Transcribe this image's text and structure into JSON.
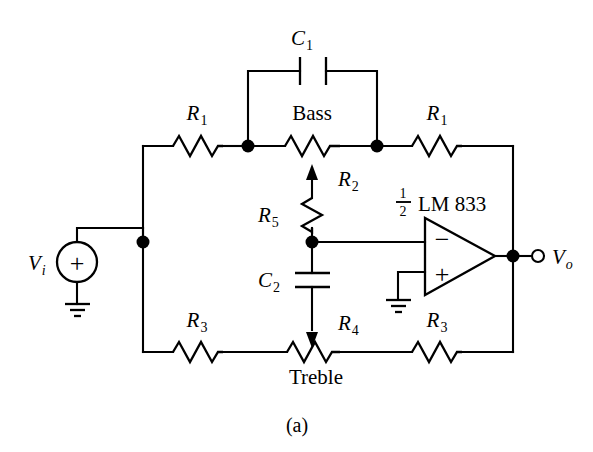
{
  "figure": {
    "caption": "(a)"
  },
  "labels": {
    "c1": "C",
    "c1_sub": "1",
    "c2": "C",
    "c2_sub": "2",
    "r1_left": "R",
    "r1_left_sub": "1",
    "r1_right": "R",
    "r1_right_sub": "1",
    "r2": "R",
    "r2_sub": "2",
    "r3_left": "R",
    "r3_left_sub": "3",
    "r3_right": "R",
    "r3_right_sub": "3",
    "r4": "R",
    "r4_sub": "4",
    "r5": "R",
    "r5_sub": "5",
    "bass": "Bass",
    "treble": "Treble",
    "opamp_part": "LM 833",
    "opamp_frac_num": "1",
    "opamp_frac_den": "2",
    "vi": "V",
    "vi_sub": "i",
    "vo": "V",
    "vo_sub": "o",
    "source_polarity": "+",
    "opamp_inverting": "−",
    "opamp_noninverting": "+"
  },
  "components": [
    {
      "name": "R1",
      "type": "resistor",
      "orientation": "horizontal",
      "label": "R1"
    },
    {
      "name": "R1b",
      "type": "resistor",
      "orientation": "horizontal",
      "label": "R1"
    },
    {
      "name": "R2",
      "type": "potentiometer",
      "orientation": "horizontal",
      "label": "R2",
      "control": "Bass"
    },
    {
      "name": "R3",
      "type": "resistor",
      "orientation": "horizontal",
      "label": "R3"
    },
    {
      "name": "R3b",
      "type": "resistor",
      "orientation": "horizontal",
      "label": "R3"
    },
    {
      "name": "R4",
      "type": "potentiometer",
      "orientation": "horizontal",
      "label": "R4",
      "control": "Treble"
    },
    {
      "name": "R5",
      "type": "resistor",
      "orientation": "vertical",
      "label": "R5"
    },
    {
      "name": "C1",
      "type": "capacitor",
      "orientation": "horizontal",
      "label": "C1"
    },
    {
      "name": "C2",
      "type": "capacitor",
      "orientation": "vertical",
      "label": "C2"
    },
    {
      "name": "U1",
      "type": "opamp",
      "label": "1/2 LM 833"
    },
    {
      "name": "V1",
      "type": "voltage-source",
      "label": "Vi"
    }
  ],
  "colors": {
    "line": "#000000",
    "background": "#ffffff",
    "text": "#000000"
  }
}
